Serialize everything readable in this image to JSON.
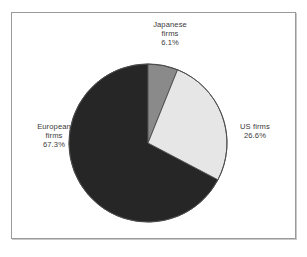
{
  "figure": {
    "background_color": "#ffffff",
    "frame_color": "#9a9a9a",
    "label_color": "#3a3a3a"
  },
  "chart_data": {
    "type": "pie",
    "title": "",
    "subtitle": "",
    "xlabel": "",
    "ylabel": "",
    "legend_position": "none",
    "grid": false,
    "start_angle_deg": 0,
    "direction": "clockwise",
    "units": "percent",
    "total": 100.0,
    "categories": [
      "Japanese firms",
      "US firms",
      "European firms"
    ],
    "values": [
      6.1,
      26.6,
      67.3
    ],
    "colors": [
      "#8a8a8a",
      "#e6e6e6",
      "#262626"
    ],
    "slice_outline_color": "#4a4a4a",
    "slices": [
      {
        "name": "Japanese firms",
        "label_line1": "Japanese",
        "label_line2": "firms",
        "value": 6.1,
        "value_label": "6.1%",
        "color": "#8a8a8a",
        "start_deg": 0.0,
        "end_deg": 21.96
      },
      {
        "name": "US firms",
        "label_line1": "US firms",
        "label_line2": "",
        "value": 26.6,
        "value_label": "26.6%",
        "color": "#e6e6e6",
        "start_deg": 21.96,
        "end_deg": 117.72
      },
      {
        "name": "European firms",
        "label_line1": "European",
        "label_line2": "firms",
        "value": 67.3,
        "value_label": "67.3%",
        "color": "#262626",
        "start_deg": 117.72,
        "end_deg": 360.0
      }
    ]
  }
}
